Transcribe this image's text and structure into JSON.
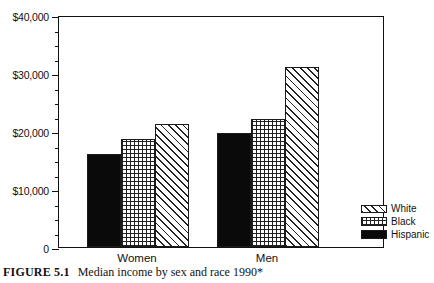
{
  "figure": {
    "caption_label": "FIGURE 5.1",
    "caption_text": "Median income by sex and race 1990*"
  },
  "chart_data": {
    "type": "bar",
    "title": "Median income by sex and race 1990*",
    "xlabel": "",
    "ylabel": "",
    "ylim": [
      0,
      40000
    ],
    "grid": false,
    "legend_position": "bottom-right",
    "categories": [
      "Women",
      "Men"
    ],
    "series": [
      {
        "name": "Hispanic",
        "pattern": "solid-black",
        "values": [
          16000,
          19700
        ]
      },
      {
        "name": "Black",
        "pattern": "cross-hatch",
        "values": [
          18700,
          22000
        ]
      },
      {
        "name": "White",
        "pattern": "diagonal-hatch",
        "values": [
          21200,
          31000
        ]
      }
    ],
    "ytick_labels": [
      "$40,000",
      "$30,000",
      "$20,000",
      "$10,000",
      "0"
    ],
    "ytick_values": [
      40000,
      30000,
      20000,
      10000,
      0
    ],
    "yminor_step": 2500
  },
  "legend": {
    "items": [
      {
        "label": "White",
        "pattern": "diagonal-hatch"
      },
      {
        "label": "Black",
        "pattern": "cross-hatch"
      },
      {
        "label": "Hispanic",
        "pattern": "solid-black"
      }
    ]
  }
}
